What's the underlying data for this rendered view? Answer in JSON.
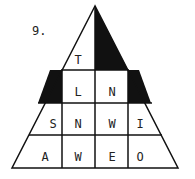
{
  "puzzle": {
    "number": "9.",
    "rows": [
      [
        "T"
      ],
      [
        "L",
        "N"
      ],
      [
        "S",
        "N",
        "W",
        "I"
      ],
      [
        "A",
        "W",
        "E",
        "O"
      ]
    ],
    "colors": {
      "line": "#111111",
      "fill": "#111111",
      "background": "#ffffff"
    }
  }
}
